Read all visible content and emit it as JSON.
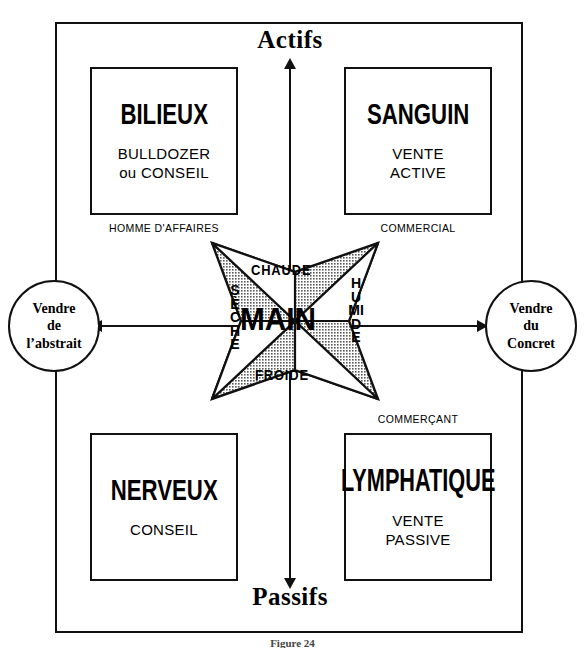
{
  "diagram": {
    "title_top": "Actifs",
    "title_bottom": "Passifs",
    "figure_caption": "Figure 24",
    "axes": {
      "vertical_top_label": "Actifs",
      "vertical_bottom_label": "Passifs",
      "horizontal_left_label": "Vendre de l'abstrait",
      "horizontal_right_label": "Vendre du Concret"
    },
    "colors": {
      "line": "#111111",
      "background": "#ffffff",
      "star_fill": "#b8b8b8",
      "star_light": "#ffffff"
    }
  },
  "quadrants": [
    {
      "id": "bilieux",
      "name": "BILIEUX",
      "role_line1": "BULLDOZER",
      "role_line2": "ou CONSEIL",
      "caption": "HOMME D'AFFAIRES"
    },
    {
      "id": "sanguin",
      "name": "SANGUIN",
      "role_line1": "VENTE",
      "role_line2": "ACTIVE",
      "caption": "COMMERCIAL"
    },
    {
      "id": "nerveux",
      "name": "NERVEUX",
      "role_line1": "CONSEIL",
      "role_line2": "",
      "caption": ""
    },
    {
      "id": "lymphatique",
      "name": "LYMPHATIQUE",
      "role_line1": "VENTE",
      "role_line2": "PASSIVE",
      "caption": "COMMERÇANT"
    }
  ],
  "circles": {
    "left": {
      "line1": "Vendre",
      "line2": "de",
      "line3": "l’abstrait"
    },
    "right": {
      "line1": "Vendre",
      "line2": "du",
      "line3": "Concret"
    }
  },
  "star": {
    "center_label": "MAIN",
    "top_label": "CHAUDE",
    "bottom_label": "FROIDE",
    "left_label": "SÈCHE",
    "right_label": "HUMIDE"
  }
}
